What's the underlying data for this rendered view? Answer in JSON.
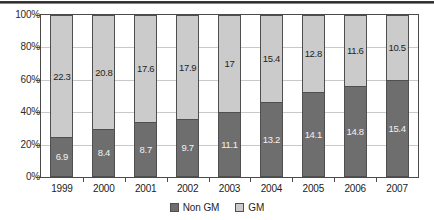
{
  "chart_data": {
    "type": "bar",
    "subtype": "100% stacked column",
    "title": "",
    "subtitle": "",
    "xlabel": "",
    "ylabel": "",
    "categories": [
      "1999",
      "2000",
      "2001",
      "2002",
      "2003",
      "2004",
      "2005",
      "2006",
      "2007"
    ],
    "series": [
      {
        "name": "Non GM",
        "color": "#6e6e6e",
        "values": [
          6.9,
          8.4,
          8.7,
          9.7,
          11.1,
          13.2,
          14.1,
          14.8,
          15.4
        ],
        "labels": [
          "6.9",
          "8.4",
          "8.7",
          "9.7",
          "11.1",
          "13.2",
          "14.1",
          "14.8",
          "15.4"
        ],
        "percent_of_total": [
          23.6,
          28.8,
          33.1,
          35.1,
          39.5,
          46.2,
          52.4,
          56.1,
          59.5
        ]
      },
      {
        "name": "GM",
        "color": "#cbcbcb",
        "values": [
          22.3,
          20.8,
          17.6,
          17.9,
          17.0,
          15.4,
          12.8,
          11.6,
          10.5
        ],
        "labels": [
          "22.3",
          "20.8",
          "17.6",
          "17.9",
          "17",
          "15.4",
          "12.8",
          "11.6",
          "10.5"
        ],
        "percent_of_total": [
          76.4,
          71.2,
          66.9,
          64.9,
          60.5,
          53.8,
          47.6,
          43.9,
          40.5
        ]
      }
    ],
    "ylim": [
      0,
      100
    ],
    "ytick_labels": [
      "0%",
      "20%",
      "40%",
      "60%",
      "80%",
      "100%"
    ],
    "ytick_values": [
      0,
      20,
      40,
      60,
      80,
      100
    ],
    "grid": true,
    "grid_axis": "y",
    "legend_position": "bottom",
    "legend_entries": [
      "Non GM",
      "GM"
    ]
  },
  "axes": {
    "y_ticks": [
      {
        "label": "100%",
        "value": 100
      },
      {
        "label": "80%",
        "value": 80
      },
      {
        "label": "60%",
        "value": 60
      },
      {
        "label": "40%",
        "value": 40
      },
      {
        "label": "20%",
        "value": 20
      },
      {
        "label": "0%",
        "value": 0
      }
    ],
    "x_ticks": [
      "1999",
      "2000",
      "2001",
      "2002",
      "2003",
      "2004",
      "2005",
      "2006",
      "2007"
    ]
  },
  "legend": {
    "items": [
      {
        "label": "Non GM",
        "color": "#6e6e6e"
      },
      {
        "label": "GM",
        "color": "#cbcbcb"
      }
    ]
  },
  "colors": {
    "non_gm": "#6e6e6e",
    "gm": "#cbcbcb",
    "frame": "#4a4a4a",
    "gridline": "#c9c9c9",
    "background": "#ffffff"
  }
}
